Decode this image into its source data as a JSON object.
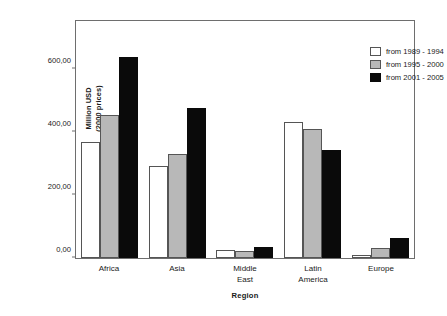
{
  "chart_data": {
    "type": "bar",
    "title": "",
    "xlabel": "Region",
    "ylabel": "Million USD\n(2000 prices)",
    "ylabel_line1": "Million USD",
    "ylabel_line2": "(2000 prices)",
    "categories": [
      "Africa",
      "Asia",
      "Middle East",
      "Latin America",
      "Europe"
    ],
    "category_lines": [
      [
        "Africa"
      ],
      [
        "Asia"
      ],
      [
        "Middle",
        "East"
      ],
      [
        "Latin",
        "America"
      ],
      [
        "Europe"
      ]
    ],
    "series": [
      {
        "name": "from 1989 - 1994",
        "color": "#ffffff",
        "values": [
          370,
          292,
          25,
          432,
          10
        ]
      },
      {
        "name": "from 1995 - 2000",
        "color": "#b8b8b8",
        "values": [
          455,
          330,
          22,
          410,
          32
        ]
      },
      {
        "name": "from 2001 - 2005",
        "color": "#0a0a0a",
        "values": [
          640,
          477,
          35,
          345,
          65
        ]
      }
    ],
    "ylim": [
      0,
      760
    ],
    "yticks": [
      0,
      200,
      400,
      600
    ],
    "ytick_labels": [
      "0,00",
      "200,00",
      "400,00",
      "600,00"
    ],
    "grid": false,
    "legend_position": "top-right"
  }
}
